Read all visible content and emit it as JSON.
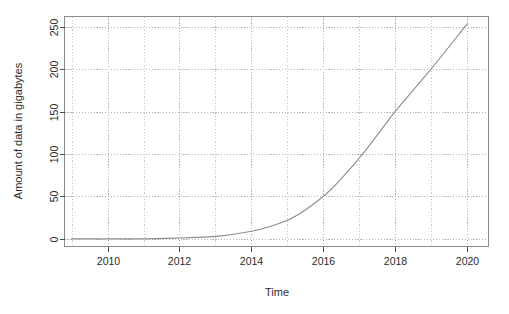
{
  "chart_data": {
    "type": "line",
    "title": "",
    "subtitle": "",
    "xlabel": "Time",
    "ylabel": "Amount of data in gigabytes",
    "xlim": [
      2008.8,
      2020.6
    ],
    "ylim": [
      -9,
      262
    ],
    "xticks": [
      2010,
      2012,
      2014,
      2016,
      2018,
      2020
    ],
    "xtick_labels": [
      "2010",
      "2012",
      "2014",
      "2016",
      "2018",
      "2020"
    ],
    "yticks": [
      0,
      50,
      100,
      150,
      200,
      250
    ],
    "ytick_labels": [
      "0",
      "50",
      "100",
      "150",
      "200",
      "250"
    ],
    "grid": true,
    "grid_style": "dotted",
    "grid_color": "#b4b4b4",
    "legend": false,
    "legend_position": "none",
    "line_color": "#8f8f8f",
    "series": [
      {
        "name": "Amount of data",
        "x": [
          2009,
          2010,
          2011,
          2012,
          2013,
          2014,
          2015,
          2016,
          2017,
          2018,
          2019,
          2020
        ],
        "values": [
          0,
          0,
          0,
          1,
          3,
          9,
          22,
          50,
          95,
          150,
          200,
          253
        ]
      }
    ]
  },
  "axes": {
    "y_label": "Amount of data in gigabytes",
    "x_label": "Time"
  }
}
